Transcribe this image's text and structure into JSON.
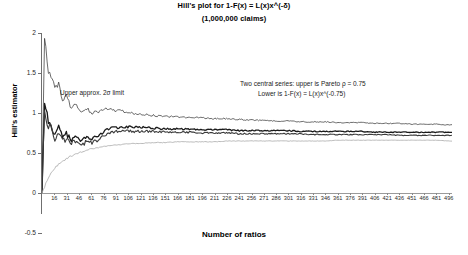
{
  "title": {
    "main": "Hill's plot for 1-F(x) = L(x)x^(-δ)",
    "sub": "(1,000,000 claims)"
  },
  "axes": {
    "ylabel": "Hill's estimator",
    "xlabel": "Number of ratios"
  },
  "annotations": {
    "sigma_limit": "Upper approx. 2σ limit",
    "central_line1": "Two central series: upper is Pareto ρ = 0.75",
    "central_line2": "Lower is 1-F(x) = L(x)x^(-0.75)"
  },
  "chart_data": {
    "type": "line",
    "title": "Hill's plot for 1-F(x) = L(x)x^(-δ) (1,000,000 claims)",
    "xlabel": "Number of ratios",
    "ylabel": "Hill's estimator",
    "grid": false,
    "legend": "none",
    "xlim": [
      1,
      500
    ],
    "ylim": [
      -0.5,
      2
    ],
    "yticks": [
      2,
      1.5,
      1,
      0.5,
      0,
      -0.5
    ],
    "xticks": [
      16,
      31,
      46,
      61,
      76,
      91,
      106,
      121,
      136,
      151,
      166,
      181,
      196,
      211,
      226,
      241,
      256,
      271,
      286,
      301,
      316,
      331,
      346,
      361,
      376,
      391,
      406,
      421,
      436,
      451,
      466,
      481,
      496
    ],
    "x": [
      1,
      4,
      8,
      12,
      16,
      21,
      26,
      31,
      36,
      41,
      46,
      51,
      56,
      61,
      71,
      81,
      91,
      101,
      111,
      121,
      136,
      151,
      166,
      181,
      196,
      211,
      226,
      241,
      256,
      271,
      286,
      301,
      316,
      331,
      346,
      361,
      376,
      391,
      406,
      421,
      436,
      451,
      466,
      481,
      496
    ],
    "series": [
      {
        "name": "Upper approx. 2σ limit",
        "color": "#2b2b2b",
        "width": 0.7,
        "values": [
          0.02,
          1.95,
          1.55,
          1.48,
          1.3,
          1.38,
          1.18,
          1.22,
          1.06,
          1.12,
          1.04,
          1.02,
          1.05,
          1.0,
          1.02,
          1.06,
          1.03,
          1.02,
          1.0,
          0.99,
          0.97,
          0.96,
          0.95,
          0.95,
          0.94,
          0.93,
          0.93,
          0.92,
          0.91,
          0.91,
          0.9,
          0.9,
          0.89,
          0.89,
          0.89,
          0.88,
          0.88,
          0.88,
          0.87,
          0.87,
          0.87,
          0.86,
          0.86,
          0.86,
          0.85
        ]
      },
      {
        "name": "Pareto ρ = 0.75 (upper central)",
        "color": "#1a1a1a",
        "width": 1.3,
        "values": [
          0.01,
          1.15,
          0.92,
          0.88,
          0.74,
          0.82,
          0.7,
          0.74,
          0.66,
          0.7,
          0.66,
          0.66,
          0.7,
          0.68,
          0.72,
          0.8,
          0.82,
          0.83,
          0.82,
          0.82,
          0.81,
          0.8,
          0.8,
          0.8,
          0.79,
          0.79,
          0.79,
          0.78,
          0.78,
          0.78,
          0.78,
          0.78,
          0.77,
          0.77,
          0.77,
          0.77,
          0.77,
          0.77,
          0.76,
          0.76,
          0.76,
          0.76,
          0.76,
          0.76,
          0.76
        ]
      },
      {
        "name": "1-F(x) = L(x)x^(-0.75) (lower central)",
        "color": "#3a3a3a",
        "width": 1.1,
        "values": [
          0.0,
          1.08,
          0.86,
          0.82,
          0.68,
          0.76,
          0.64,
          0.68,
          0.61,
          0.65,
          0.61,
          0.61,
          0.65,
          0.63,
          0.67,
          0.75,
          0.77,
          0.78,
          0.77,
          0.77,
          0.77,
          0.76,
          0.76,
          0.76,
          0.75,
          0.75,
          0.75,
          0.74,
          0.74,
          0.74,
          0.74,
          0.74,
          0.74,
          0.73,
          0.73,
          0.73,
          0.73,
          0.73,
          0.73,
          0.73,
          0.72,
          0.72,
          0.72,
          0.72,
          0.72
        ]
      },
      {
        "name": "Lower approx. 2σ limit",
        "color": "#a8a8a8",
        "width": 0.8,
        "values": [
          0.0,
          0.08,
          0.18,
          0.25,
          0.3,
          0.36,
          0.4,
          0.43,
          0.46,
          0.48,
          0.5,
          0.52,
          0.54,
          0.55,
          0.57,
          0.59,
          0.6,
          0.61,
          0.62,
          0.62,
          0.63,
          0.63,
          0.64,
          0.64,
          0.64,
          0.64,
          0.65,
          0.65,
          0.65,
          0.65,
          0.65,
          0.65,
          0.65,
          0.65,
          0.65,
          0.66,
          0.66,
          0.66,
          0.66,
          0.66,
          0.66,
          0.66,
          0.66,
          0.66,
          0.65
        ]
      }
    ]
  }
}
